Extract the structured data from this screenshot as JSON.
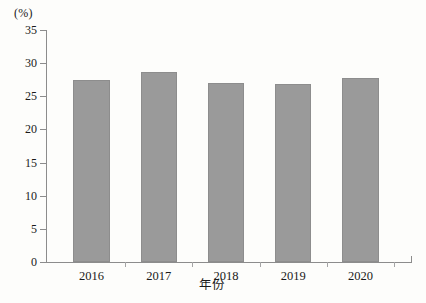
{
  "chart_data": {
    "type": "bar",
    "title": "",
    "xlabel": "年份",
    "ylabel": "(%)",
    "unit_label": "(%)",
    "categories": [
      "2016",
      "2017",
      "2018",
      "2019",
      "2020"
    ],
    "values": [
      27.5,
      28.7,
      27.0,
      26.8,
      27.8
    ],
    "series": [
      {
        "name": "",
        "values": [
          27.5,
          28.7,
          27.0,
          26.8,
          27.8
        ]
      }
    ],
    "ylim": [
      0,
      35
    ],
    "ytick_labels": [
      "0",
      "5",
      "10",
      "15",
      "20",
      "25",
      "30",
      "35"
    ],
    "ytick_values": [
      0,
      5,
      10,
      15,
      20,
      25,
      30,
      35
    ],
    "grid": false,
    "legend": false,
    "legend_position": "none",
    "bar_color": "#9a9a9a",
    "axis_color": "#8c8c8c",
    "background_color": "#fdfdfb"
  }
}
